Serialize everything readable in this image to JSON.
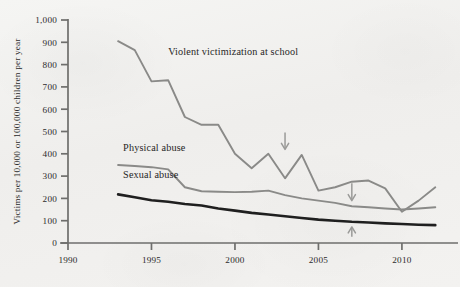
{
  "chart_data": {
    "type": "line",
    "title": "",
    "xlabel": "",
    "ylabel": "Victims per 10,000 or 100,000 children per year",
    "xlim": [
      1990,
      2013
    ],
    "ylim": [
      0,
      1000
    ],
    "grid": false,
    "legend_position": "inline-labels",
    "x_ticks": [
      "1990",
      "1995",
      "2000",
      "2005",
      "2010"
    ],
    "x_tick_values": [
      1990,
      1995,
      2000,
      2005,
      2010
    ],
    "y_ticks": [
      "0",
      "100",
      "200",
      "300",
      "400",
      "500",
      "600",
      "700",
      "800",
      "900",
      "1,000"
    ],
    "y_tick_values": [
      0,
      100,
      200,
      300,
      400,
      500,
      600,
      700,
      800,
      900,
      1000
    ],
    "series": [
      {
        "name": "Violent victimization at school",
        "color": "#8a8a88",
        "width": 1.9,
        "label_x": 1996.0,
        "label_y": 845,
        "x": [
          1993,
          1994,
          1995,
          1996,
          1997,
          1998,
          1999,
          2000,
          2001,
          2002,
          2003,
          2004,
          2005,
          2006,
          2007,
          2008,
          2009,
          2010,
          2011,
          2012
        ],
        "values": [
          905,
          865,
          725,
          730,
          565,
          530,
          530,
          400,
          335,
          400,
          290,
          395,
          235,
          250,
          275,
          280,
          245,
          140,
          190,
          250
        ]
      },
      {
        "name": "Physical abuse",
        "color": "#8a8a88",
        "width": 1.9,
        "label_x": 1993.3,
        "label_y": 412,
        "x": [
          1993,
          1994,
          1995,
          1996,
          1997,
          1998,
          1999,
          2000,
          2001,
          2002,
          2003,
          2004,
          2005,
          2006,
          2007,
          2008,
          2009,
          2010,
          2011,
          2012
        ],
        "values": [
          350,
          345,
          340,
          330,
          250,
          232,
          230,
          228,
          230,
          235,
          215,
          200,
          190,
          180,
          165,
          160,
          155,
          150,
          155,
          160
        ]
      },
      {
        "name": "Sexual abuse",
        "color": "#1f1f1f",
        "width": 2.6,
        "label_x": 1993.3,
        "label_y": 292,
        "x": [
          1993,
          1994,
          1995,
          1996,
          1997,
          1998,
          1999,
          2000,
          2001,
          2002,
          2003,
          2004,
          2005,
          2006,
          2007,
          2008,
          2009,
          2010,
          2011,
          2012
        ],
        "values": [
          218,
          205,
          192,
          185,
          175,
          168,
          155,
          145,
          135,
          128,
          120,
          112,
          105,
          100,
          95,
          92,
          88,
          85,
          82,
          80
        ]
      }
    ],
    "annotations": [
      {
        "name": "arrow-2003-violent-peak",
        "direction": "down",
        "x": 2003.0,
        "y_from": 495,
        "y_to": 420,
        "color": "#9a9a98"
      },
      {
        "name": "arrow-2007-physical",
        "direction": "down",
        "x": 2007.0,
        "y_from": 268,
        "y_to": 190,
        "color": "#9a9a98"
      },
      {
        "name": "arrow-2007-sexual",
        "direction": "up",
        "x": 2007.0,
        "y_from": 28,
        "y_to": 72,
        "color": "#9a9a98"
      }
    ]
  }
}
